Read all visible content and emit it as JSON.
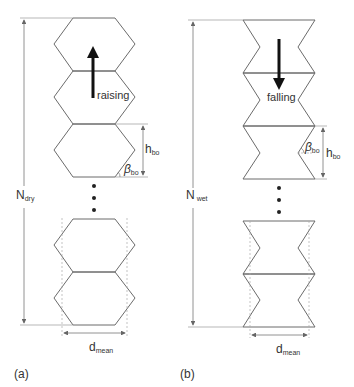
{
  "panel_a": {
    "tag": "(a)",
    "motion_label": "raising",
    "height_symbol": "N",
    "height_sub": "dry",
    "element_height_symbol": "h",
    "element_height_sub": "bo",
    "angle_symbol": "β",
    "angle_sub": "bo",
    "width_symbol": "d",
    "width_sub": "mean",
    "shape": "hexagon",
    "arrow_direction": "up"
  },
  "panel_b": {
    "tag": "(b)",
    "motion_label": "falling",
    "height_symbol": "N",
    "height_sub": "wet",
    "element_height_symbol": "h",
    "element_height_sub": "bo",
    "angle_symbol": "β",
    "angle_sub": "bo",
    "width_symbol": "d",
    "width_sub": "mean",
    "shape": "bowtie",
    "arrow_direction": "down"
  },
  "colors": {
    "outline": "#6b6b6b",
    "dim_line": "#888888",
    "arrow": "#111111",
    "text": "#333333"
  }
}
